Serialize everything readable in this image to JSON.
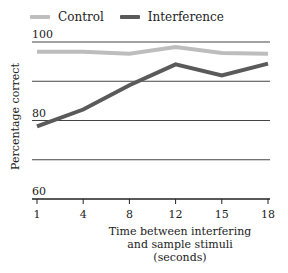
{
  "chart_data": {
    "type": "line",
    "title": "",
    "x": [
      1,
      4,
      8,
      12,
      15,
      18
    ],
    "categories": [
      "1",
      "4",
      "8",
      "12",
      "15",
      "18"
    ],
    "series": [
      {
        "name": "Control",
        "color": "#bdbdbd",
        "values": [
          97.5,
          97.5,
          97,
          98.7,
          97.2,
          97
        ]
      },
      {
        "name": "Interference",
        "color": "#5a5a5a",
        "values": [
          78.5,
          82.8,
          89,
          94.3,
          91.5,
          94.5
        ]
      }
    ],
    "xlabel": "Time between interfering and sample stimuli (seconds)",
    "xlabel_lines": [
      "Time between interfering",
      "and sample stimuli",
      "(seconds)"
    ],
    "ylabel": "Percentage correct",
    "ylim": [
      60,
      100
    ],
    "yticks_labeled": [
      "100",
      "80",
      "60"
    ],
    "gridlines": [
      100,
      90,
      80,
      70
    ],
    "grid": true,
    "legend_position": "top-left"
  },
  "legend": [
    {
      "label": "Control",
      "color": "#bdbdbd"
    },
    {
      "label": "Interference",
      "color": "#5a5a5a"
    }
  ]
}
